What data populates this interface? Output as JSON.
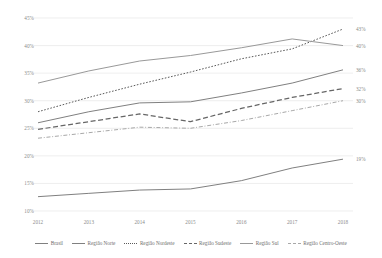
{
  "chart_data": {
    "type": "line",
    "title": "",
    "xlabel": "",
    "ylabel": "",
    "x": [
      "2012",
      "2013",
      "2014",
      "2015",
      "2016",
      "2017",
      "2018"
    ],
    "ylim": [
      10,
      45
    ],
    "yticks": [
      "10%",
      "15%",
      "20%",
      "25%",
      "30%",
      "35%",
      "40%",
      "45%"
    ],
    "ytick_values": [
      10,
      15,
      20,
      25,
      30,
      35,
      40,
      45
    ],
    "grid": true,
    "legend_position": "bottom",
    "series": [
      {
        "name": "Brasil",
        "style": "solid",
        "color": "#808080",
        "values": [
          26.0,
          28.0,
          29.6,
          29.8,
          31.4,
          33.2,
          35.6
        ],
        "end_label": "36%"
      },
      {
        "name": "Região Norte",
        "style": "solid",
        "color": "#808080",
        "values": [
          12.6,
          13.2,
          13.8,
          14.0,
          15.5,
          17.8,
          19.4
        ],
        "end_label": "19%"
      },
      {
        "name": "Região Nordeste",
        "style": "dotted",
        "color": "#5a5a5a",
        "values": [
          28.0,
          30.6,
          33.0,
          35.2,
          37.6,
          39.4,
          43.0
        ],
        "end_label": "43%"
      },
      {
        "name": "Região Sudeste",
        "style": "dashed",
        "color": "#666666",
        "values": [
          24.8,
          26.2,
          27.6,
          26.2,
          28.6,
          30.6,
          32.2
        ],
        "end_label": "32%"
      },
      {
        "name": "Região Sul",
        "style": "solid",
        "color": "#999999",
        "values": [
          33.2,
          35.4,
          37.2,
          38.2,
          39.6,
          41.2,
          40.0
        ],
        "end_label": "40%"
      },
      {
        "name": "Região Centro-Oeste",
        "style": "dashdot",
        "color": "#a8a8a8",
        "values": [
          23.2,
          24.2,
          25.2,
          25.0,
          26.4,
          28.2,
          30.0
        ],
        "end_label": "30%"
      }
    ]
  },
  "legend": {
    "items": [
      {
        "label": "Brasil"
      },
      {
        "label": "Região Norte"
      },
      {
        "label": "Região Nordeste"
      },
      {
        "label": "Região Sudeste"
      },
      {
        "label": "Região Sul"
      },
      {
        "label": "Região Centro-Oeste"
      }
    ]
  }
}
